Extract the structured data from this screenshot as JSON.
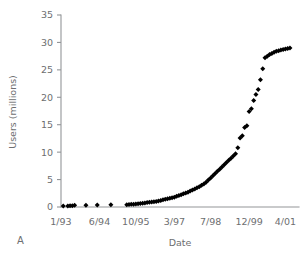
{
  "panel": {
    "label": "A"
  },
  "chart_data": {
    "type": "scatter",
    "title": "",
    "subtitle": "",
    "xlabel": "Date",
    "ylabel": "Users (millions)",
    "ylim": [
      0,
      35
    ],
    "yticks": [
      0,
      5,
      10,
      15,
      20,
      25,
      30,
      35
    ],
    "ytick_labels": [
      "0",
      "5",
      "10",
      "15",
      "20",
      "25",
      "30",
      "35"
    ],
    "xtick_labels": [
      "1/93",
      "6/94",
      "10/95",
      "3/97",
      "7/98",
      "12/99",
      "4/01"
    ],
    "xtick_positions": [
      0,
      17,
      33,
      50,
      66,
      83,
      99
    ],
    "xlim": [
      0,
      105
    ],
    "grid": false,
    "legend": null,
    "marker": "diamond",
    "marker_color": "#000000",
    "axis_color": "#939598",
    "series": [
      {
        "name": "Internet users",
        "x": [
          1,
          3,
          4,
          5,
          6,
          11,
          16,
          22,
          29,
          30,
          31,
          32,
          33,
          34,
          35,
          36,
          37,
          38,
          39,
          40,
          41,
          42,
          43,
          44,
          45,
          46,
          47,
          48,
          49,
          50,
          51,
          52,
          53,
          54,
          55,
          56,
          57,
          58,
          59,
          60,
          61,
          62,
          63,
          64,
          65,
          66,
          67,
          68,
          69,
          70,
          71,
          72,
          73,
          74,
          75,
          76,
          77,
          78,
          79,
          80,
          81,
          82,
          83,
          84,
          85,
          86,
          87,
          88,
          89,
          90,
          91,
          92,
          93,
          94,
          95,
          96,
          97,
          98,
          99,
          100,
          101
        ],
        "y": [
          0.2,
          0.2,
          0.25,
          0.25,
          0.3,
          0.3,
          0.35,
          0.4,
          0.4,
          0.45,
          0.5,
          0.5,
          0.55,
          0.6,
          0.65,
          0.7,
          0.75,
          0.8,
          0.85,
          0.9,
          0.95,
          1.0,
          1.1,
          1.2,
          1.3,
          1.4,
          1.5,
          1.6,
          1.7,
          1.8,
          1.95,
          2.1,
          2.25,
          2.4,
          2.55,
          2.7,
          2.9,
          3.1,
          3.3,
          3.5,
          3.7,
          3.95,
          4.2,
          4.5,
          4.9,
          5.3,
          5.7,
          6.1,
          6.5,
          6.9,
          7.3,
          7.7,
          8.1,
          8.5,
          8.9,
          9.3,
          9.7,
          10.8,
          12.6,
          13.0,
          14.5,
          14.8,
          17.4,
          17.9,
          19.4,
          20.5,
          21.4,
          23.2,
          25.2,
          27.2,
          27.5,
          27.8,
          28.0,
          28.2,
          28.4,
          28.5,
          28.6,
          28.7,
          28.8,
          28.9,
          29.0
        ]
      }
    ]
  }
}
